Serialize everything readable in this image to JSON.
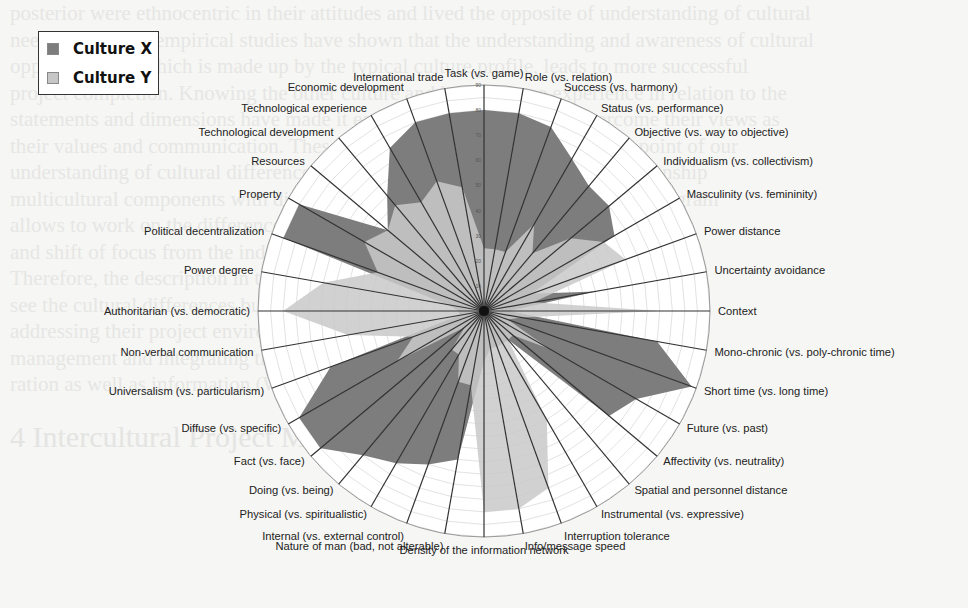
{
  "legend": {
    "items": [
      {
        "label": "Culture X",
        "color": "#7d7d7d"
      },
      {
        "label": "Culture Y",
        "color": "#c6c6c6"
      }
    ]
  },
  "chart_data": {
    "type": "radar",
    "title": "",
    "scale": {
      "min": 0,
      "max": 90,
      "ticks": [
        0,
        10,
        20,
        30,
        40,
        50,
        60,
        70,
        80,
        90
      ]
    },
    "grid": true,
    "legend_position": "top-left",
    "categories": [
      "Task (vs. game)",
      "Role (vs. relation)",
      "Success (vs. harmony)",
      "Status (vs. performance)",
      "Objective (vs. way to objective)",
      "Individualism (vs. collectivism)",
      "Masculinity (vs. femininity)",
      "Power distance",
      "Uncertainty avoidance",
      "Context",
      "Mono-chronic (vs. poly-chronic time)",
      "Short time (vs. long time)",
      "Future (vs. past)",
      "Affectivity (vs. neutrality)",
      "Spatial and personnel distance",
      "Instrumental (vs. expressive)",
      "Interruption tolerance",
      "Info/message speed",
      "Density of the information network",
      "Nature of man (bad, not alterable)",
      "Internal (vs. external control)",
      "Physical (vs. spiritualistic)",
      "Doing (vs. being)",
      "Fact (vs. face)",
      "Diffuse (vs. specific)",
      "Universalism (vs. particularism)",
      "Non-verbal communication",
      "Authoritarian (vs. democratic)",
      "Power degree",
      "Political decentralization",
      "Property",
      "Resources",
      "Technological development",
      "Technological experience",
      "Economic development",
      "International trade"
    ],
    "series": [
      {
        "name": "Culture X",
        "values": [
          80,
          80,
          78,
          70,
          65,
          65,
          60,
          20,
          45,
          10,
          70,
          88,
          70,
          65,
          15,
          15,
          15,
          15,
          20,
          60,
          65,
          70,
          75,
          85,
          85,
          65,
          10,
          10,
          15,
          85,
          85,
          50,
          60,
          75,
          80,
          80
        ]
      },
      {
        "name": "Culture Y",
        "values": [
          25,
          25,
          25,
          40,
          30,
          45,
          55,
          60,
          20,
          70,
          15,
          10,
          30,
          15,
          15,
          50,
          75,
          80,
          80,
          30,
          30,
          20,
          20,
          10,
          40,
          30,
          55,
          80,
          65,
          45,
          55,
          50,
          55,
          50,
          55,
          50
        ]
      }
    ]
  },
  "background_text": {
    "lines": [
      "posterior were ethnocentric in their attitudes and lived the opposite of understanding of cultural",
      "needs. However, empirical studies have shown that the understanding and awareness of cultural",
      "opposite cases, which is made up by the typical culture profile, leads to more successful",
      "project completion. Knowing the other culture and having some experience in relation to the",
      "statements and dimensions have made it easier for project teams to overcome their views as",
      "their values and communication. These culture dimensions are the starting point of our",
      "understanding of cultural differences and awareness. For example, one relationship",
      "multicultural components with different cultural profiles. Consequently, the diagram",
      "allows to work on the differences between the two cultures' values and norms,",
      "and shift of focus from the individual cultural dimension to a holistic",
      "Therefore, the description in the diagram is essential since they should not only",
      "see the cultural differences but also understand these cultural issues when",
      "addressing their project environment, the different communication and",
      "management and integrating the different intercultural cooperation and collabo-",
      "ration as well as information (Wallace and Frank 2002; Chen 2003)."
    ],
    "heading": "4   Intercultural Project Management"
  }
}
